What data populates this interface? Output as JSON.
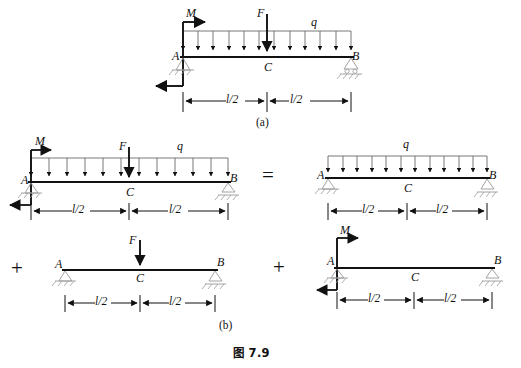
{
  "figure": {
    "caption": "图 7.9",
    "part_labels": {
      "a": "(a)",
      "b": "(b)"
    },
    "operators": {
      "equals": "=",
      "plus": "+"
    }
  },
  "labels": {
    "moment": "M",
    "force": "F",
    "distributed": "q",
    "node_a": "A",
    "node_b": "B",
    "node_c": "C",
    "half_span": "l/2"
  },
  "diagrams": [
    {
      "id": "diagram-a",
      "part": "(a)",
      "loads": [
        "M",
        "F",
        "q"
      ],
      "supports": {
        "left": "pin",
        "right": "roller"
      },
      "nodes": [
        "A",
        "C",
        "B"
      ],
      "dimensions": [
        "l/2",
        "l/2"
      ],
      "distributed_arrow_count": 12
    },
    {
      "id": "diagram-b-combined",
      "part": "(b)",
      "loads": [
        "M",
        "F",
        "q"
      ],
      "supports": {
        "left": "pin",
        "right": "roller"
      },
      "nodes": [
        "A",
        "C",
        "B"
      ],
      "dimensions": [
        "l/2",
        "l/2"
      ],
      "distributed_arrow_count": 12
    },
    {
      "id": "diagram-b-q-only",
      "part": "(b)",
      "loads": [
        "q"
      ],
      "supports": {
        "left": "pin",
        "right": "roller"
      },
      "nodes": [
        "A",
        "C",
        "B"
      ],
      "dimensions": [
        "l/2",
        "l/2"
      ],
      "distributed_arrow_count": 12
    },
    {
      "id": "diagram-b-f-only",
      "part": "(b)",
      "loads": [
        "F"
      ],
      "supports": {
        "left": "pin",
        "right": "roller"
      },
      "nodes": [
        "A",
        "C",
        "B"
      ],
      "dimensions": [
        "l/2",
        "l/2"
      ],
      "distributed_arrow_count": 0
    },
    {
      "id": "diagram-b-m-only",
      "part": "(b)",
      "loads": [
        "M"
      ],
      "supports": {
        "left": "pin",
        "right": "roller"
      },
      "nodes": [
        "A",
        "C",
        "B"
      ],
      "dimensions": [
        "l/2",
        "l/2"
      ],
      "distributed_arrow_count": 0
    }
  ],
  "colors": {
    "ink": "#111111",
    "background": "#ffffff",
    "thin_line": "#555555"
  }
}
